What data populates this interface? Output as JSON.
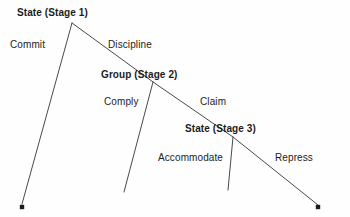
{
  "diagram": {
    "type": "tree",
    "background_color": "#fefefe",
    "line_color": "#4a4a4a",
    "text_color": "#1c1c1c",
    "nodes": [
      {
        "id": "stage1",
        "label": "State (Stage 1)",
        "x": 72,
        "y": 23,
        "bold": true
      },
      {
        "id": "stage2",
        "label": "Group (Stage 2)",
        "x": 153,
        "y": 82,
        "bold": true
      },
      {
        "id": "stage3",
        "label": "State (Stage 3)",
        "x": 233,
        "y": 137,
        "bold": true
      }
    ],
    "terminals": [
      {
        "id": "terminal-left",
        "x": 22,
        "y": 207,
        "marker": "dot"
      },
      {
        "id": "terminal-right",
        "x": 318,
        "y": 207,
        "marker": "dot"
      }
    ],
    "edges": [
      {
        "id": "commit",
        "label": "Commit",
        "from": "stage1",
        "to": "terminal-left",
        "x1": 72,
        "y1": 23,
        "x2": 22,
        "y2": 205
      },
      {
        "id": "discipline",
        "label": "Discipline",
        "from": "stage1",
        "to": "stage2",
        "x1": 72,
        "y1": 23,
        "x2": 153,
        "y2": 82
      },
      {
        "id": "comply",
        "label": "Comply",
        "from": "stage2",
        "to": "open-mid",
        "x1": 153,
        "y1": 82,
        "x2": 124,
        "y2": 192
      },
      {
        "id": "claim",
        "label": "Claim",
        "from": "stage2",
        "to": "stage3",
        "x1": 153,
        "y1": 82,
        "x2": 233,
        "y2": 137
      },
      {
        "id": "accommodate",
        "label": "Accommodate",
        "from": "stage3",
        "to": "open-right",
        "x1": 233,
        "y1": 137,
        "x2": 228,
        "y2": 190
      },
      {
        "id": "repress",
        "label": "Repress",
        "from": "stage3",
        "to": "terminal-right",
        "x1": 233,
        "y1": 137,
        "x2": 318,
        "y2": 205
      }
    ]
  }
}
